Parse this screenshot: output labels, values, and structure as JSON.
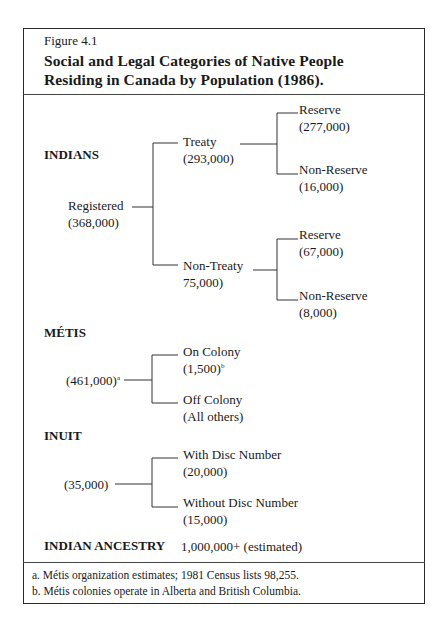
{
  "figure": {
    "label": "Figure 4.1",
    "title_line1": "Social and Legal Categories of Native People",
    "title_line2": "Residing in Canada by Population (1986)."
  },
  "indians": {
    "heading": "INDIANS",
    "registered": {
      "label": "Registered",
      "value": "(368,000)"
    },
    "treaty": {
      "label": "Treaty",
      "value": "(293,000)",
      "reserve": {
        "label": "Reserve",
        "value": "(277,000)"
      },
      "non_reserve": {
        "label": "Non-Reserve",
        "value": "(16,000)"
      }
    },
    "non_treaty": {
      "label": "Non-Treaty",
      "value": "75,000)",
      "reserve": {
        "label": "Reserve",
        "value": "(67,000)"
      },
      "non_reserve": {
        "label": "Non-Reserve",
        "value": "(8,000)"
      }
    }
  },
  "metis": {
    "heading": "MÉTIS",
    "value": "(461,000)",
    "value_note": "a",
    "on_colony": {
      "label": "On Colony",
      "value": "(1,500)",
      "note": "b"
    },
    "off_colony": {
      "label": "Off Colony",
      "value": "(All others)"
    }
  },
  "inuit": {
    "heading": "INUIT",
    "value": "(35,000)",
    "with_disc": {
      "label": "With Disc Number",
      "value": "(20,000)"
    },
    "without_disc": {
      "label": "Without Disc Number",
      "value": "(15,000)"
    }
  },
  "indian_ancestry": {
    "heading": "INDIAN ANCESTRY",
    "value": "1,000,000+ (estimated)"
  },
  "footnotes": [
    "a. Métis organization estimates; 1981 Census lists 98,255.",
    "b. Métis colonies operate in Alberta and British Columbia."
  ]
}
